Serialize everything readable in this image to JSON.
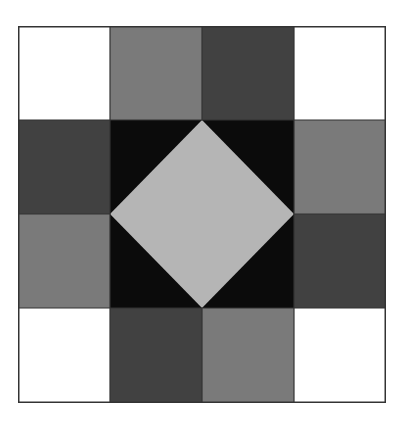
{
  "diagram": {
    "type": "quilt-block",
    "grid": {
      "rows": 4,
      "cols": 4
    },
    "colors": {
      "white": "#ffffff",
      "medium": "#7a7a7a",
      "dark": "#414141",
      "black": "#0b0b0b",
      "light": "#b5b5b5",
      "outline": "#333333"
    },
    "cells": [
      [
        "white",
        "medium",
        "dark",
        "white"
      ],
      [
        "dark",
        "black",
        "black",
        "medium"
      ],
      [
        "medium",
        "black",
        "black",
        "dark"
      ],
      [
        "white",
        "dark",
        "medium",
        "white"
      ]
    ],
    "center_diamond": {
      "fill": "light",
      "background": "black"
    }
  }
}
